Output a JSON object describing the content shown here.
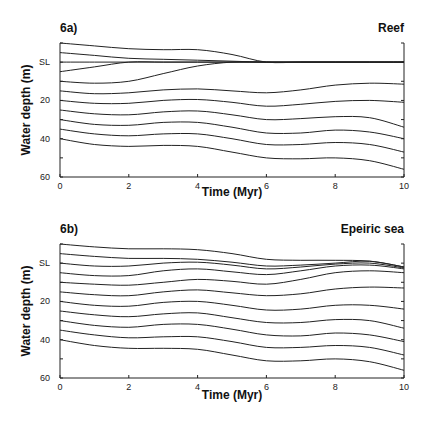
{
  "chart_data": [
    {
      "type": "line",
      "panel_label": "6a)",
      "title": "Reef",
      "xlabel": "Time (Myr)",
      "ylabel": "Water depth (m)",
      "xlim": [
        0,
        10
      ],
      "ylim": [
        -10,
        60
      ],
      "y_inverted": true,
      "xticks": [
        0,
        2,
        4,
        6,
        8,
        10
      ],
      "yticks": [
        {
          "value": 0,
          "label": "SL"
        },
        {
          "value": 20,
          "label": "20"
        },
        {
          "value": 40,
          "label": "40"
        },
        {
          "value": 60,
          "label": "60"
        }
      ],
      "grid": false,
      "x": [
        0,
        1,
        2,
        3,
        4,
        5,
        6,
        7,
        8,
        9,
        10
      ],
      "series": [
        {
          "name": "line-1",
          "values": [
            -10,
            -8.5,
            -7,
            -6.5,
            -6.5,
            -4,
            0,
            0,
            0,
            0,
            0
          ]
        },
        {
          "name": "line-2",
          "values": [
            -5,
            -3.5,
            -2,
            -1.5,
            -1,
            -0.5,
            0,
            0,
            0,
            0,
            0
          ]
        },
        {
          "name": "line-3",
          "values": [
            0,
            0,
            0,
            0,
            0,
            0,
            0,
            0,
            0,
            0,
            0
          ]
        },
        {
          "name": "line-4",
          "values": [
            5,
            2.5,
            0,
            0,
            0,
            0,
            0,
            0,
            0,
            0,
            0
          ]
        },
        {
          "name": "line-5",
          "values": [
            10,
            11,
            10,
            6,
            2,
            0,
            0,
            0,
            0,
            0,
            0
          ]
        },
        {
          "name": "line-6",
          "values": [
            15,
            16.5,
            16,
            14.5,
            14,
            15,
            16,
            14.5,
            12,
            11,
            11.5
          ]
        },
        {
          "name": "line-7",
          "values": [
            20,
            21.5,
            21.5,
            20,
            19.5,
            21,
            23,
            22,
            20.5,
            20,
            21
          ]
        },
        {
          "name": "line-8",
          "values": [
            25,
            27,
            27.5,
            26,
            25.5,
            27.5,
            30,
            29.5,
            28.5,
            29,
            34
          ]
        },
        {
          "name": "line-9",
          "values": [
            30,
            32.5,
            33,
            31.5,
            31.5,
            34,
            37,
            37,
            35.5,
            36.5,
            40
          ]
        },
        {
          "name": "line-10",
          "values": [
            35,
            37.5,
            38.5,
            37.5,
            37.5,
            40,
            43,
            43,
            42,
            43,
            47
          ]
        },
        {
          "name": "line-11",
          "values": [
            40,
            43,
            44,
            43.5,
            44,
            47,
            50,
            50.5,
            50,
            51.5,
            56
          ]
        }
      ]
    },
    {
      "type": "line",
      "panel_label": "6b)",
      "title": "Epeiric sea",
      "xlabel": "Time (Myr)",
      "ylabel": "Water depth (m)",
      "xlim": [
        0,
        10
      ],
      "ylim": [
        -10,
        60
      ],
      "y_inverted": true,
      "xticks": [
        0,
        2,
        4,
        6,
        8,
        10
      ],
      "yticks": [
        {
          "value": 0,
          "label": "SL"
        },
        {
          "value": 20,
          "label": "20"
        },
        {
          "value": 40,
          "label": "40"
        },
        {
          "value": 60,
          "label": "60"
        }
      ],
      "grid": false,
      "x": [
        0,
        1,
        2,
        3,
        4,
        5,
        6,
        7,
        8,
        9,
        10
      ],
      "series": [
        {
          "name": "line-1",
          "values": [
            -10,
            -8.5,
            -7.5,
            -7.5,
            -7,
            -5,
            -2,
            -1.5,
            -1.5,
            -1,
            2
          ]
        },
        {
          "name": "line-2",
          "values": [
            -5,
            -3.5,
            -2.5,
            -2.5,
            -2,
            -0.5,
            1.5,
            1,
            0,
            -1,
            2
          ]
        },
        {
          "name": "line-3",
          "values": [
            0,
            1.5,
            1.5,
            0,
            -0.5,
            1,
            3,
            2,
            0.5,
            0,
            2.5
          ]
        },
        {
          "name": "line-4",
          "values": [
            5,
            6.5,
            6.5,
            4,
            3,
            4.5,
            6,
            4,
            1.5,
            1,
            3
          ]
        },
        {
          "name": "line-5",
          "values": [
            10,
            11,
            11.5,
            10,
            8.5,
            9.5,
            11,
            8.5,
            5,
            4,
            5
          ]
        },
        {
          "name": "line-6",
          "values": [
            15,
            16.5,
            17,
            15,
            14,
            15.5,
            17,
            16,
            13.5,
            12.5,
            13
          ]
        },
        {
          "name": "line-7",
          "values": [
            20,
            22,
            22.5,
            20.5,
            20,
            22,
            24.5,
            24,
            22,
            22,
            24
          ]
        },
        {
          "name": "line-8",
          "values": [
            25,
            27,
            28,
            26.5,
            26,
            28.5,
            31,
            31,
            29.5,
            30,
            34
          ]
        },
        {
          "name": "line-9",
          "values": [
            30,
            32.5,
            33.5,
            32,
            32,
            34.5,
            37.5,
            38,
            36.5,
            37.5,
            41
          ]
        },
        {
          "name": "line-10",
          "values": [
            35,
            37.5,
            39,
            38.5,
            38.5,
            41,
            44,
            44,
            43,
            44,
            48
          ]
        },
        {
          "name": "line-11",
          "values": [
            40,
            43,
            44.5,
            44.5,
            45,
            48,
            51,
            51,
            50,
            51.5,
            56
          ]
        }
      ]
    }
  ],
  "panels": [
    {
      "label": "6a)",
      "title": "Reef",
      "xlabel": "Time (Myr)",
      "ylabel": "Water depth (m)"
    },
    {
      "label": "6b)",
      "title": "Epeiric sea",
      "xlabel": "Time (Myr)",
      "ylabel": "Water depth (m)"
    }
  ],
  "colors": {
    "line": "#222222",
    "background": "#ffffff"
  }
}
